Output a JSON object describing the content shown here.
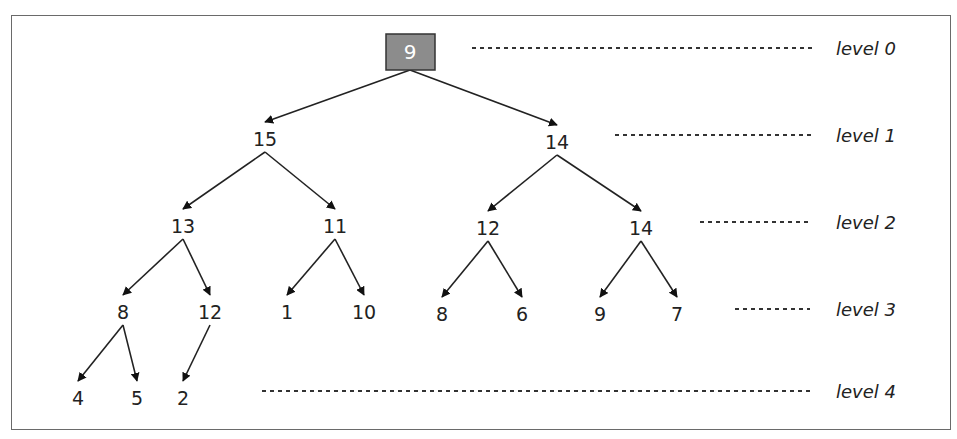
{
  "diagram": {
    "type": "binary-heap-tree",
    "root": {
      "value": "9",
      "fill": "#8c8c8c",
      "text_color": "#ffffff"
    },
    "nodes": [
      {
        "id": "n0",
        "value": "9",
        "x": 410,
        "y": 52,
        "level": 0
      },
      {
        "id": "n1",
        "value": "15",
        "x": 265,
        "y": 139,
        "level": 1
      },
      {
        "id": "n2",
        "value": "14",
        "x": 557,
        "y": 142,
        "level": 1
      },
      {
        "id": "n3",
        "value": "13",
        "x": 183,
        "y": 226,
        "level": 2
      },
      {
        "id": "n4",
        "value": "11",
        "x": 335,
        "y": 226,
        "level": 2
      },
      {
        "id": "n5",
        "value": "12",
        "x": 488,
        "y": 228,
        "level": 2
      },
      {
        "id": "n6",
        "value": "14",
        "x": 641,
        "y": 228,
        "level": 2
      },
      {
        "id": "n7",
        "value": "8",
        "x": 123,
        "y": 312,
        "level": 3
      },
      {
        "id": "n8",
        "value": "12",
        "x": 210,
        "y": 312,
        "level": 3
      },
      {
        "id": "n9",
        "value": "1",
        "x": 287,
        "y": 312,
        "level": 3
      },
      {
        "id": "n10",
        "value": "10",
        "x": 364,
        "y": 312,
        "level": 3
      },
      {
        "id": "n11",
        "value": "8",
        "x": 442,
        "y": 314,
        "level": 3
      },
      {
        "id": "n12",
        "value": "6",
        "x": 522,
        "y": 314,
        "level": 3
      },
      {
        "id": "n13",
        "value": "9",
        "x": 600,
        "y": 314,
        "level": 3
      },
      {
        "id": "n14",
        "value": "7",
        "x": 677,
        "y": 314,
        "level": 3
      },
      {
        "id": "n15",
        "value": "4",
        "x": 78,
        "y": 398,
        "level": 4
      },
      {
        "id": "n16",
        "value": "5",
        "x": 137,
        "y": 398,
        "level": 4
      },
      {
        "id": "n17",
        "value": "2",
        "x": 183,
        "y": 398,
        "level": 4
      }
    ],
    "edges": [
      [
        "n0",
        "n1"
      ],
      [
        "n0",
        "n2"
      ],
      [
        "n1",
        "n3"
      ],
      [
        "n1",
        "n4"
      ],
      [
        "n2",
        "n5"
      ],
      [
        "n2",
        "n6"
      ],
      [
        "n3",
        "n7"
      ],
      [
        "n3",
        "n8"
      ],
      [
        "n4",
        "n9"
      ],
      [
        "n4",
        "n10"
      ],
      [
        "n5",
        "n11"
      ],
      [
        "n5",
        "n12"
      ],
      [
        "n6",
        "n13"
      ],
      [
        "n6",
        "n14"
      ],
      [
        "n7",
        "n15"
      ],
      [
        "n7",
        "n16"
      ],
      [
        "n8",
        "n17"
      ]
    ],
    "levels": [
      {
        "label": "level 0",
        "dash_x1": 472,
        "dash_x2": 815,
        "y": 48
      },
      {
        "label": "level 1",
        "dash_x1": 615,
        "dash_x2": 815,
        "y": 135
      },
      {
        "label": "level 2",
        "dash_x1": 700,
        "dash_x2": 810,
        "y": 222
      },
      {
        "label": "level 3",
        "dash_x1": 735,
        "dash_x2": 810,
        "y": 309
      },
      {
        "label": "level 4",
        "dash_x1": 262,
        "dash_x2": 810,
        "y": 391
      }
    ]
  }
}
